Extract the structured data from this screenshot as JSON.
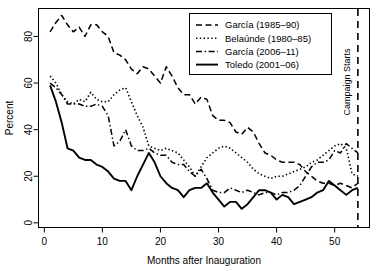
{
  "chart_data": {
    "type": "line",
    "title": "",
    "xlabel": "Months after Inauguration",
    "ylabel": "Percent",
    "xlim": [
      -1,
      56
    ],
    "ylim": [
      -2,
      92
    ],
    "xticks": [
      0,
      10,
      20,
      30,
      40,
      50
    ],
    "yticks": [
      0,
      20,
      40,
      60,
      80
    ],
    "grid": false,
    "legend_position": "top-right",
    "annotations": [
      {
        "name": "campaign-starts",
        "label": "Campaign Starts",
        "x": 54,
        "style": "dashed-vertical-line",
        "rotated": true
      }
    ],
    "series": [
      {
        "name": "García (1985–90)",
        "style": "dashed",
        "x": [
          1,
          2,
          3,
          4,
          5,
          6,
          7,
          8,
          9,
          10,
          11,
          12,
          13,
          14,
          15,
          16,
          17,
          18,
          19,
          20,
          21,
          22,
          23,
          24,
          25,
          26,
          27,
          28,
          29,
          30,
          31,
          32,
          33,
          34,
          35,
          36,
          37,
          38,
          39,
          40,
          41,
          42,
          43,
          44,
          45,
          46,
          47,
          48,
          49,
          50,
          51,
          52,
          53,
          54
        ],
        "values": [
          82,
          86,
          89,
          85,
          82,
          84,
          80,
          85,
          85,
          82,
          80,
          73,
          72,
          70,
          66,
          64,
          67,
          66,
          63,
          60,
          67,
          63,
          58,
          55,
          55,
          51,
          54,
          53,
          46,
          44,
          44,
          43,
          39,
          38,
          41,
          39,
          34,
          30,
          29,
          27,
          26,
          26,
          26,
          25,
          22,
          20,
          18,
          17,
          17,
          16,
          17,
          16,
          15,
          17
        ]
      },
      {
        "name": "Belaúnde (1980–85)",
        "style": "dotted",
        "x": [
          1,
          2,
          3,
          4,
          5,
          6,
          7,
          8,
          9,
          10,
          11,
          12,
          13,
          14,
          15,
          16,
          17,
          18,
          19,
          20,
          21,
          22,
          23,
          24,
          25,
          26,
          27,
          28,
          29,
          30,
          31,
          32,
          33,
          34,
          35,
          36,
          37,
          38,
          39,
          40,
          41,
          42,
          43,
          44,
          45,
          46,
          47,
          48,
          49,
          50,
          51,
          52,
          53,
          54
        ],
        "values": [
          63,
          60,
          55,
          52,
          51,
          53,
          52,
          56,
          53,
          52,
          52,
          55,
          57,
          58,
          52,
          46,
          41,
          33,
          32,
          31,
          32,
          31,
          30,
          27,
          24,
          20,
          24,
          28,
          30,
          32,
          33,
          32,
          30,
          28,
          26,
          23,
          21,
          20,
          19,
          20,
          20,
          21,
          22,
          23,
          24,
          26,
          27,
          29,
          31,
          33,
          34,
          32,
          21,
          20
        ]
      },
      {
        "name": "García (2006–11)",
        "style": "dash-dot",
        "x": [
          1,
          2,
          3,
          4,
          5,
          6,
          7,
          8,
          9,
          10,
          11,
          12,
          13,
          14,
          15,
          16,
          17,
          18,
          19,
          20,
          21,
          22,
          23,
          24,
          25,
          26,
          27,
          28,
          29,
          30,
          31,
          32,
          33,
          34,
          35,
          36,
          37,
          38,
          39,
          40,
          41,
          42,
          43,
          44,
          45,
          46,
          47,
          48,
          49,
          50,
          51,
          52,
          53,
          54
        ],
        "values": [
          60,
          58,
          55,
          51,
          51,
          51,
          50,
          50,
          51,
          50,
          46,
          33,
          35,
          40,
          33,
          31,
          31,
          32,
          30,
          29,
          29,
          26,
          25,
          25,
          22,
          20,
          23,
          19,
          14,
          13,
          13,
          15,
          14,
          13,
          14,
          13,
          12,
          13,
          13,
          12,
          13,
          13,
          14,
          16,
          20,
          24,
          26,
          26,
          27,
          31,
          30,
          34,
          32,
          30
        ]
      },
      {
        "name": "Toledo (2001–06)",
        "style": "solid",
        "x": [
          1,
          2,
          3,
          4,
          5,
          6,
          7,
          8,
          9,
          10,
          11,
          12,
          13,
          14,
          15,
          16,
          17,
          18,
          19,
          20,
          21,
          22,
          23,
          24,
          25,
          26,
          27,
          28,
          29,
          30,
          31,
          32,
          33,
          34,
          35,
          36,
          37,
          38,
          39,
          40,
          41,
          42,
          43,
          44,
          45,
          46,
          47,
          48,
          49,
          50,
          51,
          52,
          53,
          54
        ],
        "values": [
          59,
          52,
          43,
          32,
          31,
          28,
          27,
          27,
          25,
          24,
          22,
          19,
          18,
          18,
          14,
          20,
          25,
          30,
          26,
          20,
          17,
          15,
          14,
          11,
          14,
          15,
          15,
          17,
          13,
          10,
          7,
          9,
          9,
          6,
          8,
          11,
          14,
          14,
          13,
          10,
          12,
          11,
          8,
          9,
          10,
          11,
          13,
          14,
          18,
          16,
          14,
          12,
          14,
          15
        ]
      }
    ]
  },
  "legend": {
    "items": [
      {
        "label": "García (1985–90)",
        "style": "dashed"
      },
      {
        "label": "Belaúnde (1980–85)",
        "style": "dotted"
      },
      {
        "label": "García (2006–11)",
        "style": "dash-dot"
      },
      {
        "label": "Toledo (2001–06)",
        "style": "solid"
      }
    ]
  },
  "axes": {
    "x_label": "Months after Inauguration",
    "y_label": "Percent",
    "x_tick_labels": [
      "0",
      "10",
      "20",
      "30",
      "40",
      "50"
    ],
    "y_tick_labels": [
      "0",
      "20",
      "40",
      "60",
      "80"
    ]
  },
  "campaign_line": {
    "label": "Campaign Starts"
  },
  "colors": {
    "line": "#000000",
    "background": "#ffffff",
    "axis": "#000000"
  }
}
